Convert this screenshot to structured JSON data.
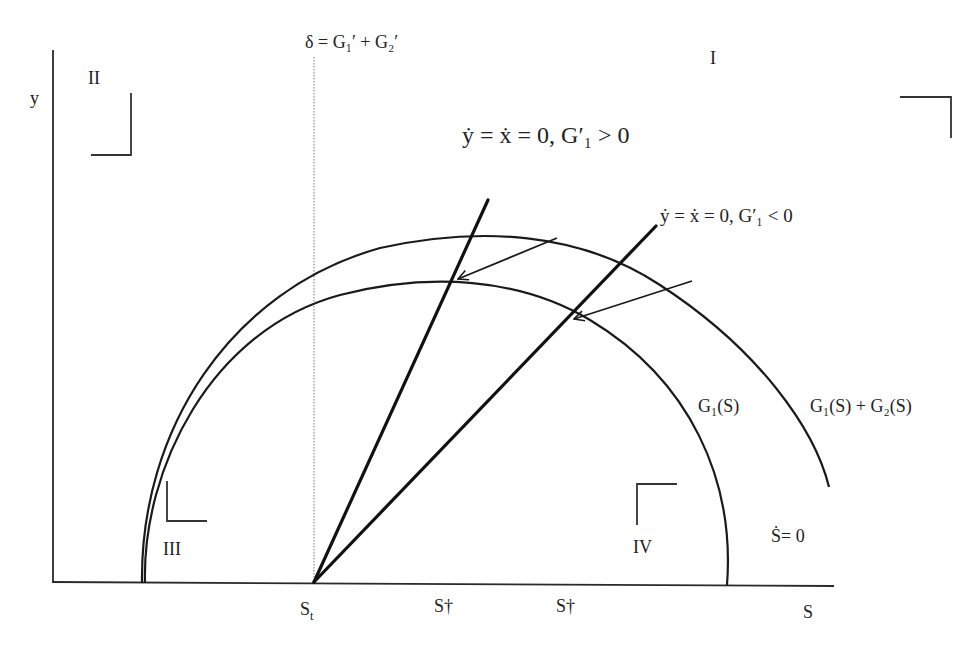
{
  "diagram": {
    "type": "phase-diagram",
    "axes": {
      "x_label": "S",
      "y_label": "y"
    },
    "vertical_line_label": "δ = G₁′ + G₂′",
    "isoclines": {
      "positive": "ẏ = ẋ = 0, G′₁ > 0",
      "negative": "ẏ = ẋ = 0, G′₁ < 0"
    },
    "curves": {
      "inner": "G₁(S)",
      "outer": "G₁(S) + G₂(S)",
      "stationary": "Ṡ= 0"
    },
    "quadrants": {
      "q1": "I",
      "q2": "II",
      "q3": "III",
      "q4": "IV"
    },
    "x_ticks": {
      "st": "S",
      "st_sub": "t",
      "sdagger1": "S†",
      "sdagger2": "S†"
    }
  }
}
